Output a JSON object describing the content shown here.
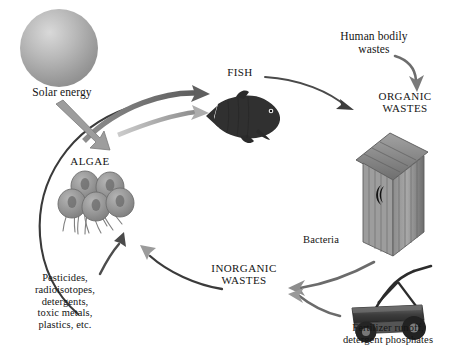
{
  "diagram": {
    "background_color": "#ffffff",
    "ink_color": "#141414",
    "arrow_color": "#5a5a5a",
    "labels": {
      "solar_energy": "Solar energy",
      "algae": "ALGAE",
      "fish": "FISH",
      "human_bodily_wastes": "Human bodily\nwastes",
      "organic_wastes": "ORGANIC\nWASTES",
      "bacteria": "Bacteria",
      "inorganic_wastes": "INORGANIC\nWASTES",
      "fertilizer_runoff": "Fertilizer runoff,\ndetergent phosphates",
      "pollutants": "Pesticides,\nradioisotopes,\ndetergents,\ntoxic metals,\nplastics, etc."
    },
    "figures": {
      "sun": "sun-sphere",
      "algae_cells": "algae-cluster",
      "fish": "fish-silhouette",
      "outhouse": "outhouse-illustration",
      "lawnmower": "reel-lawnmower-illustration"
    },
    "flows": [
      {
        "from": "Solar energy",
        "to": "ALGAE"
      },
      {
        "from": "ALGAE",
        "to": "FISH"
      },
      {
        "from": "FISH",
        "to": "ORGANIC WASTES"
      },
      {
        "from": "Human bodily wastes",
        "to": "ORGANIC WASTES"
      },
      {
        "from": "ORGANIC WASTES",
        "to": "INORGANIC WASTES",
        "via": "Bacteria"
      },
      {
        "from": "Fertilizer runoff, detergent phosphates",
        "to": "INORGANIC WASTES"
      },
      {
        "from": "INORGANIC WASTES",
        "to": "ALGAE"
      },
      {
        "from": "Pesticides, radioisotopes, detergents, toxic metals, plastics, etc.",
        "to": "ALGAE"
      }
    ]
  }
}
